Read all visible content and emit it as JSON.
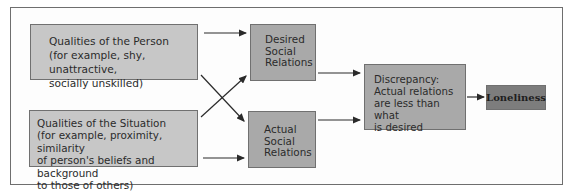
{
  "diagram": {
    "nodes": {
      "person": {
        "title": "Qualities of the Person",
        "lines": [
          "(for example, shy, unattractive,",
          "socially unskilled)"
        ]
      },
      "situation": {
        "title": "Qualities of the Situation",
        "lines": [
          "(for example, proximity, similarity",
          "of person's beliefs and background",
          "to those of others)"
        ]
      },
      "desired": {
        "lines": [
          "Desired",
          "Social",
          "Relations"
        ]
      },
      "actual": {
        "lines": [
          "Actual",
          "Social",
          "Relations"
        ]
      },
      "discrepancy": {
        "lines": [
          "Discrepancy:",
          "Actual relations",
          "are less than what",
          "is desired"
        ]
      },
      "loneliness": {
        "label": "Loneliness"
      }
    },
    "edges": [
      [
        "person",
        "desired"
      ],
      [
        "person",
        "actual"
      ],
      [
        "situation",
        "desired"
      ],
      [
        "situation",
        "actual"
      ],
      [
        "desired",
        "discrepancy"
      ],
      [
        "actual",
        "discrepancy"
      ],
      [
        "discrepancy",
        "loneliness"
      ]
    ],
    "colors": {
      "qualities_fill": "#c7c7c7",
      "relations_fill": "#a9a9a9",
      "discrepancy_fill": "#a9a9a9",
      "loneliness_fill": "#7d7d7d",
      "line": "#2a2a2a"
    }
  }
}
